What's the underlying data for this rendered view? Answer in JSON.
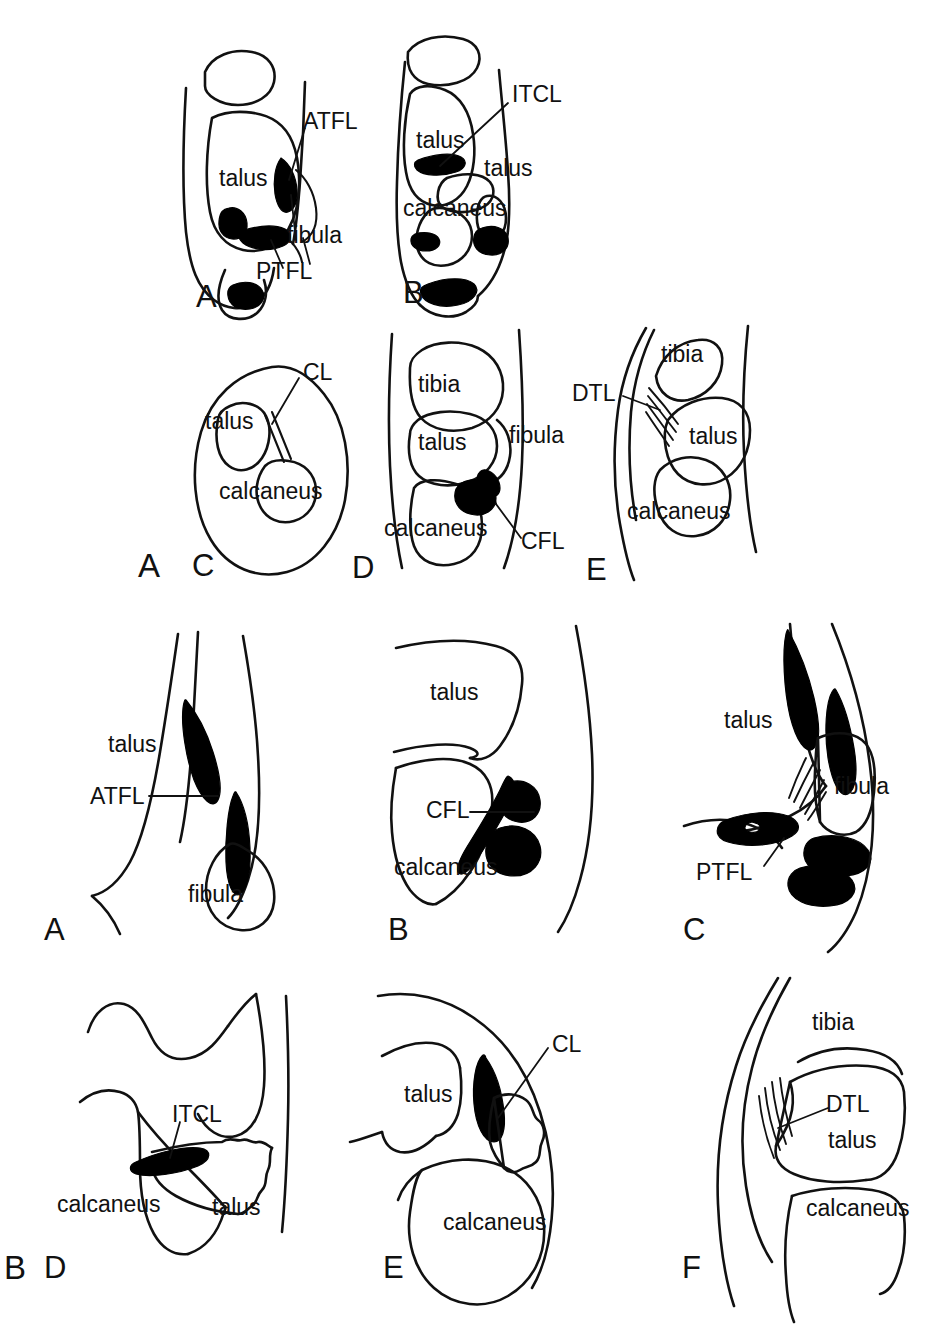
{
  "figure": {
    "background_color": "#ffffff",
    "line_color": "#111111",
    "ligament_fill_color": "#000000",
    "groups": [
      {
        "id": "group-a",
        "letter": "A"
      },
      {
        "id": "group-b",
        "letter": "B"
      }
    ]
  },
  "panels": {
    "a1": {
      "letter": "A",
      "bones": [
        "talus",
        "fibula"
      ],
      "bone_labels": {
        "talus": "talus",
        "fibula": "fibula"
      },
      "ligament_labels": {
        "atfl": "ATFL",
        "ptfl": "PTFL"
      }
    },
    "a2": {
      "letter": "B",
      "bone_labels": {
        "talus_upper": "talus",
        "talus_lower": "talus",
        "calcaneus": "calcaneus"
      },
      "ligament_labels": {
        "itcl": "ITCL"
      }
    },
    "a3": {
      "letter": "C",
      "bone_labels": {
        "talus": "talus",
        "calcaneus": "calcaneus"
      },
      "ligament_labels": {
        "cl": "CL"
      }
    },
    "a4": {
      "letter": "D",
      "bone_labels": {
        "tibia": "tibia",
        "talus": "talus",
        "fibula": "fibula",
        "calcaneus": "calcaneus"
      },
      "ligament_labels": {
        "cfl": "CFL"
      }
    },
    "a5": {
      "letter": "E",
      "bone_labels": {
        "tibia": "tibia",
        "talus": "talus",
        "calcaneus": "calcaneus"
      },
      "ligament_labels": {
        "dtl": "DTL"
      }
    },
    "b1": {
      "letter": "A",
      "bone_labels": {
        "talus": "talus",
        "fibula": "fibula"
      },
      "ligament_labels": {
        "atfl": "ATFL"
      }
    },
    "b2": {
      "letter": "B",
      "bone_labels": {
        "talus": "talus",
        "calcaneus": "calcaneus"
      },
      "ligament_labels": {
        "cfl": "CFL"
      }
    },
    "b3": {
      "letter": "C",
      "bone_labels": {
        "talus": "talus",
        "fibula": "fibula"
      },
      "ligament_labels": {
        "ptfl": "PTFL"
      }
    },
    "b4": {
      "letter": "D",
      "bone_labels": {
        "calcaneus": "calcaneus",
        "talus": "talus"
      },
      "ligament_labels": {
        "itcl": "ITCL"
      }
    },
    "b5": {
      "letter": "E",
      "bone_labels": {
        "talus": "talus",
        "calcaneus": "calcaneus"
      },
      "ligament_labels": {
        "cl": "CL"
      }
    },
    "b6": {
      "letter": "F",
      "bone_labels": {
        "tibia": "tibia",
        "talus": "talus",
        "calcaneus": "calcaneus"
      },
      "ligament_labels": {
        "dtl": "DTL"
      }
    }
  }
}
